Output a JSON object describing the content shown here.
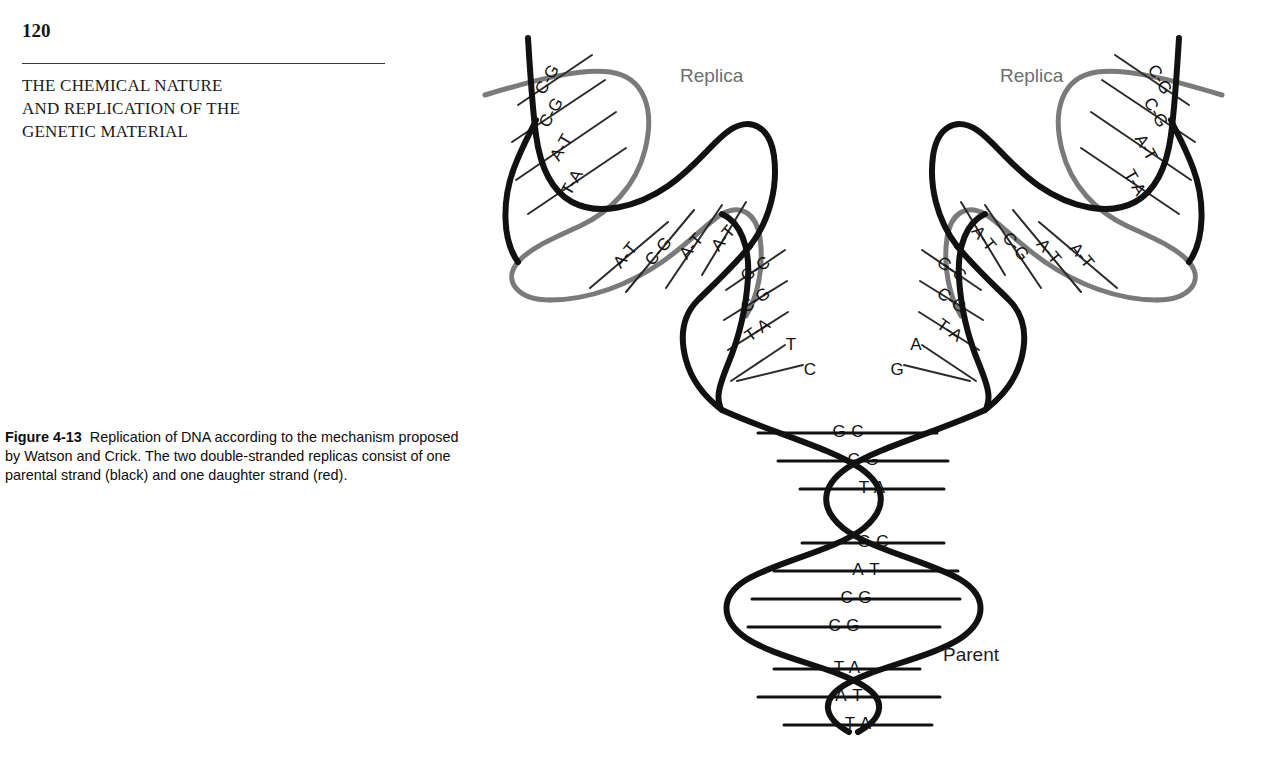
{
  "page": {
    "number": "120",
    "chapter_title_lines": [
      "THE CHEMICAL NATURE",
      "AND REPLICATION OF THE",
      "GENETIC MATERIAL"
    ]
  },
  "caption": {
    "figure_label": "Figure 4-13",
    "text": "Replication of DNA according to the mechanism proposed by Watson and Crick. The two double-stranded replicas consist of one parental strand (black) and one daughter strand (red)."
  },
  "figure": {
    "title": "Replication of DNA according to the mechanism proposed by Watson and Crick",
    "labels": {
      "replica_left": "Replica",
      "replica_right": "Replica",
      "parent": "Parent"
    },
    "colors": {
      "parental_strand": "#111111",
      "daughter_strand": "#7a7a7a",
      "rung_line": "#2b2b2b",
      "base_text": "#111111",
      "replica_label": "#6e6e6e",
      "parent_label": "#1d1d1d",
      "background": "#ffffff"
    },
    "parent_helix_pairs": [
      "G-C",
      "C-G",
      "T-A",
      "G-C",
      "A-T",
      "C-G",
      "C-G",
      "T-A",
      "A-T",
      "T-A"
    ],
    "fork_left_branch_pairs": [
      "G-C",
      "C-G",
      "T-A"
    ],
    "fork_left_unpaired_bases": [
      "T",
      "C"
    ],
    "fork_right_branch_pairs": [
      "G-C",
      "C-G",
      "T-A"
    ],
    "fork_right_unpaired_bases": [
      "A",
      "G"
    ],
    "replica_left_arm": {
      "outer_segment_pairs": [
        "C-G",
        "C-G",
        "A-T",
        "T-A"
      ],
      "middle_segment_pairs": [
        "A-T",
        "C-G",
        "A-T",
        "A-T"
      ]
    },
    "replica_right_arm": {
      "outer_segment_pairs": [
        "C-G",
        "C-G",
        "A-T",
        "T-A"
      ],
      "middle_segment_pairs": [
        "A-T",
        "A-T",
        "C-G",
        "A-T"
      ]
    }
  }
}
